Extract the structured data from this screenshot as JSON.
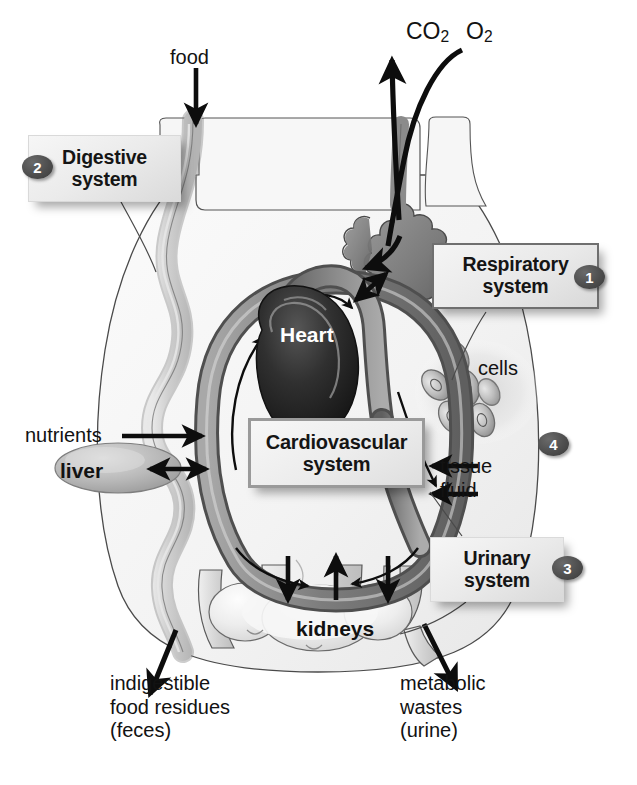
{
  "diagram": {
    "background_color": "#ffffff"
  },
  "system_boxes": [
    {
      "id": "respiratory",
      "label_line1": "Respiratory",
      "label_line2": "system",
      "number": "1",
      "border_color": "#6f6f6f"
    },
    {
      "id": "digestive",
      "label_line1": "Digestive",
      "label_line2": "system",
      "number": "2",
      "border_color": "#d9d9d9"
    },
    {
      "id": "urinary",
      "label_line1": "Urinary",
      "label_line2": "system",
      "number": "3",
      "border_color": "#dadada"
    },
    {
      "id": "cardiovascular",
      "label_line1": "Cardiovascular",
      "label_line2": "system",
      "number": "",
      "border_color": "#9a9a9a"
    }
  ],
  "badges": {
    "one": "1",
    "two": "2",
    "three": "3",
    "four": "4"
  },
  "labels": {
    "food": "food",
    "co2": "CO",
    "co2_sub": "2",
    "o2": "O",
    "o2_sub": "2",
    "heart": "Heart",
    "cells": "cells",
    "nutrients": "nutrients",
    "liver": "liver",
    "tissue_fluid_line1": "tissue",
    "tissue_fluid_line2": "fluid",
    "kidneys": "kidneys",
    "feces_line1": "indigestible",
    "feces_line2": "food residues",
    "feces_line3": "(feces)",
    "urine_line1": "metabolic",
    "urine_line2": "wastes",
    "urine_line3": "(urine)"
  },
  "colors": {
    "artery": "#8a8a8a",
    "vein": "#6e6e6e",
    "heart_dark": "#2b2b2b",
    "body_fill": "#f4f4f4",
    "organ_gray": "#c9c9c9",
    "badge_fill": "#4e4e4e",
    "text": "#121212"
  }
}
